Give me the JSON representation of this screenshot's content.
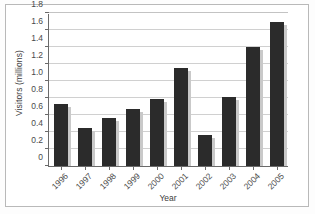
{
  "chart_data": {
    "type": "bar",
    "title": "",
    "xlabel": "Year",
    "ylabel": "Visitors (millions)",
    "categories": [
      "1996",
      "1997",
      "1998",
      "1999",
      "2000",
      "2001",
      "2002",
      "2003",
      "2004",
      "2005"
    ],
    "values": [
      0.73,
      0.45,
      0.57,
      0.67,
      0.79,
      1.15,
      0.37,
      0.81,
      1.4,
      1.7
    ],
    "ylim": [
      0,
      1.8
    ],
    "ytick_labels": [
      "0",
      "0.2",
      "0.4",
      "0.6",
      "0.8",
      "1.0",
      "1.2",
      "1.4",
      "1.6",
      "1.8"
    ],
    "ytick_values": [
      0,
      0.2,
      0.4,
      0.6,
      0.8,
      1.0,
      1.2,
      1.4,
      1.6,
      1.8
    ],
    "grid": "horizontal",
    "legend": "none",
    "bar_color": "#2b2b2b",
    "gridline_color": "#d0d0d0",
    "axis_color": "#6a6a6a",
    "background_color": "#ffffff"
  }
}
